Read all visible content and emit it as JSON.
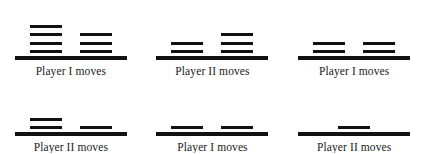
{
  "diagram": {
    "background_color": "#ffffff",
    "stick_color": "#111111",
    "text_color": "#1a1a1a",
    "rows": 2,
    "columns": 3
  },
  "positions": [
    {
      "id": "position-1",
      "heaps": [
        4,
        3
      ],
      "total_sticks": 7,
      "caption": "Player I moves"
    },
    {
      "id": "position-2",
      "heaps": [
        2,
        3
      ],
      "total_sticks": 5,
      "caption": "Player II moves"
    },
    {
      "id": "position-3",
      "heaps": [
        2,
        2
      ],
      "total_sticks": 4,
      "caption": "Player I moves"
    },
    {
      "id": "position-4",
      "heaps": [
        2,
        1
      ],
      "total_sticks": 3,
      "caption": "Player II moves"
    },
    {
      "id": "position-5",
      "heaps": [
        1,
        1
      ],
      "total_sticks": 2,
      "caption": "Player I moves"
    },
    {
      "id": "position-6",
      "heaps": [
        1
      ],
      "total_sticks": 1,
      "caption": "Player II moves"
    }
  ]
}
